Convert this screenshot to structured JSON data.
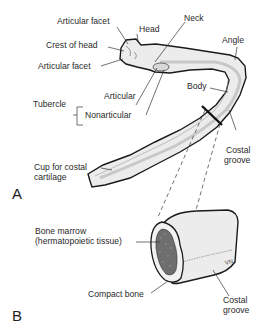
{
  "figure": {
    "panels": [
      {
        "id": "A",
        "label": "A",
        "title": "Typical rib",
        "labels": {
          "articular_facet_top": "Articular facet",
          "head": "Head",
          "neck": "Neck",
          "crest_of_head": "Crest of head",
          "articular_facet_bottom": "Articular facet",
          "angle": "Angle",
          "tubercle": "Tubercle",
          "tubercle_articular": "Articular",
          "tubercle_nonarticular": "Nonarticular",
          "body": "Body",
          "costal_groove": "Costal\ngroove",
          "costal_groove_line1": "Costal",
          "costal_groove_line2": "groove",
          "cup_line1": "Cup for costal",
          "cup_line2": "cartilage"
        }
      },
      {
        "id": "B",
        "label": "B",
        "title": "Cross-section of rib body",
        "labels": {
          "bone_marrow_line1": "Bone marrow",
          "bone_marrow_line2": "(hermatopoietic tissue)",
          "compact_bone": "Compact bone",
          "costal_groove_line1": "Costal",
          "costal_groove_line2": "groove",
          "vessel_mark": "VN"
        }
      }
    ],
    "colors": {
      "outline": "#1a1a1a",
      "bone_fill": "#e9e9e9",
      "bone_shade": "#cfcfcf",
      "marrow": "#6e6e6e",
      "leader": "#333333",
      "text": "#2a2a2a"
    }
  }
}
